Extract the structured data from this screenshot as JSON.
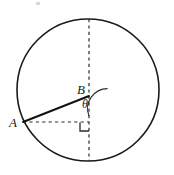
{
  "figure": {
    "type": "geometry-diagram",
    "background_color": "#ffffff",
    "stroke_color": "#1a1a1a",
    "canvas": {
      "width": 174,
      "height": 175
    }
  },
  "circle": {
    "name": "circle",
    "center_x": 88,
    "center_y": 90,
    "radius": 71,
    "stroke_width": 1.6,
    "style": "solid"
  },
  "points": {
    "A": {
      "label": "A",
      "x": 23,
      "y": 122
    },
    "B": {
      "label": "B",
      "x": 89,
      "y": 96
    },
    "foot": {
      "label": "",
      "x": 89,
      "y": 122
    },
    "top": {
      "label": "",
      "x": 89,
      "y": 19
    },
    "bottom": {
      "label": "",
      "x": 89,
      "y": 161
    }
  },
  "segments": [
    {
      "name": "vertical-diameter",
      "style": "dashed",
      "x1": 89,
      "y1": 19,
      "x2": 89,
      "y2": 161
    },
    {
      "name": "horizontal-leg",
      "style": "dashed",
      "x1": 23,
      "y1": 122,
      "x2": 89,
      "y2": 122
    },
    {
      "name": "chord-AB",
      "style": "solid",
      "x1": 23,
      "y1": 122,
      "x2": 89,
      "y2": 96
    }
  ],
  "angle": {
    "name": "theta",
    "label": "θ",
    "vertex": "B",
    "between": [
      "BA",
      "B-downward-vertical"
    ],
    "arc_radius": 20,
    "style": "solid"
  },
  "right_angle": {
    "name": "right-angle-mark",
    "vertex_x": 89,
    "vertex_y": 122,
    "size": 9,
    "style": "solid"
  },
  "labels": {
    "A": "A",
    "B": "B",
    "theta": "θ"
  }
}
